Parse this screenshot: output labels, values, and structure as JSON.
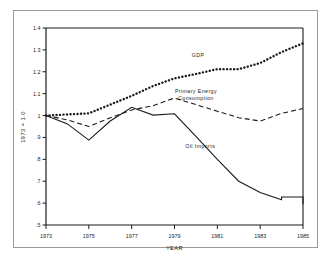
{
  "figure": {
    "background_color": "#ffffff",
    "line_color": "#1b1b1b",
    "frame_color": "#9a9a9a"
  },
  "chart_data": {
    "type": "line",
    "title": "",
    "subtitle": "",
    "xlabel": "YEAR",
    "ylabel": "1973 = 1.0",
    "xlim": [
      1973,
      1985
    ],
    "ylim": [
      0.5,
      1.4
    ],
    "grid": false,
    "legend_position": "inline-annotations",
    "x_tick_labels": [
      "1973",
      "1975",
      "1977",
      "1979",
      "1981",
      "1983",
      "1985"
    ],
    "x_tick_values": [
      1973,
      1975,
      1977,
      1979,
      1981,
      1983,
      1985
    ],
    "y_tick_labels": [
      "1.4",
      "1.3",
      "1.2",
      "1.1",
      "1",
      ".9",
      ".8",
      ".7",
      ".6",
      ".5"
    ],
    "y_tick_values": [
      1.4,
      1.3,
      1.2,
      1.1,
      1.0,
      0.9,
      0.8,
      0.7,
      0.6,
      0.5
    ],
    "x": [
      1973,
      1974,
      1975,
      1976,
      1977,
      1978,
      1979,
      1980,
      1981,
      1982,
      1983,
      1984,
      1985
    ],
    "series": [
      {
        "name": "GDP",
        "label": "GDP",
        "style": "dotted",
        "label_x": 1980.1,
        "label_y": 1.268,
        "values": [
          1.0,
          1.005,
          1.01,
          1.05,
          1.09,
          1.135,
          1.17,
          1.19,
          1.212,
          1.212,
          1.24,
          1.29,
          1.33
        ]
      },
      {
        "name": "Primary Energy Consumption",
        "label": "Primary Energy\nConsumption",
        "label_line1": "Primary Energy",
        "label_line2": "Consumption",
        "style": "dashed",
        "label_x": 1980.0,
        "label_y": 1.105,
        "values": [
          1.0,
          0.98,
          0.95,
          0.99,
          1.025,
          1.045,
          1.08,
          1.05,
          1.02,
          0.99,
          0.975,
          1.01,
          1.032
        ]
      },
      {
        "name": "Oil Imports",
        "label": "Oil  Imports",
        "style": "solid",
        "label_x": 1980.2,
        "label_y": 0.853,
        "values": [
          1.0,
          0.962,
          0.888,
          0.975,
          1.038,
          1.002,
          1.008,
          0.905,
          0.8,
          0.7,
          0.648,
          0.615,
          0.628
        ]
      }
    ],
    "series_segment_overrides": {
      "Oil Imports": [
        {
          "x": 1984.0,
          "y": 0.628
        },
        {
          "x": 1985.0,
          "y": 0.595
        }
      ]
    }
  }
}
